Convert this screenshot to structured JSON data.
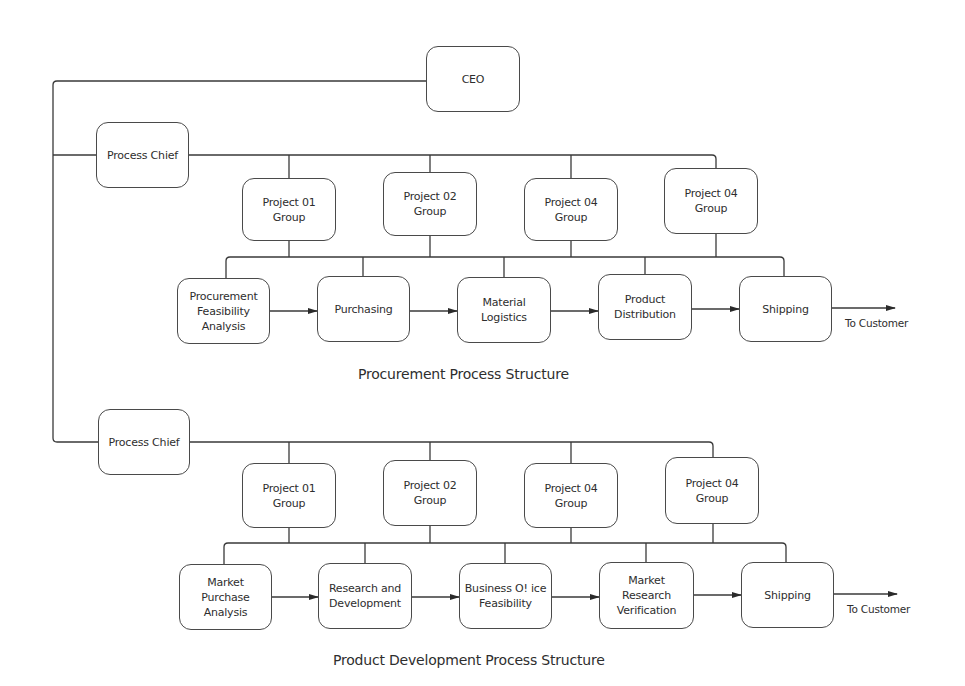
{
  "ceo": {
    "label": "CEO"
  },
  "sections": [
    {
      "caption": "Procurement Process Structure",
      "chief": {
        "label": "Process Chief"
      },
      "groups": [
        {
          "label": "Project 01\nGroup"
        },
        {
          "label": "Project 02\nGroup"
        },
        {
          "label": "Project 04\nGroup"
        },
        {
          "label": "Project 04\nGroup"
        }
      ],
      "steps": [
        {
          "label": "Procurement\nFeasibility\nAnalysis"
        },
        {
          "label": "Purchasing"
        },
        {
          "label": "Material\nLogistics"
        },
        {
          "label": "Product\nDistribution"
        },
        {
          "label": "Shipping"
        }
      ],
      "output_label": "To Customer"
    },
    {
      "caption": "Product Development Process Structure",
      "chief": {
        "label": "Process Chief"
      },
      "groups": [
        {
          "label": "Project 01\nGroup"
        },
        {
          "label": "Project 02\nGroup"
        },
        {
          "label": "Project 04\nGroup"
        },
        {
          "label": "Project 04\nGroup"
        }
      ],
      "steps": [
        {
          "label": "Market\nPurchase\nAnalysis"
        },
        {
          "label": "Research and\nDevelopment"
        },
        {
          "label": "Business O! ice\nFeasibility"
        },
        {
          "label": "Market\nResearch\nVerification"
        },
        {
          "label": "Shipping"
        }
      ],
      "output_label": "To Customer"
    }
  ],
  "colors": {
    "line": "#3a3a3a",
    "box_border": "#4a4a4a",
    "text": "#2e2e2e",
    "background": "#ffffff"
  }
}
